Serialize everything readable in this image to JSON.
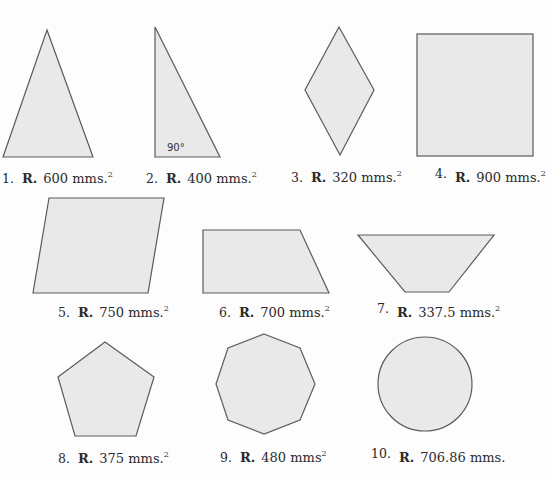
{
  "figures": [
    {
      "number": "1.",
      "shape": "isosceles-triangle",
      "answer_prefix": "R.",
      "value": "600",
      "unit": "mms.",
      "exponent": "2"
    },
    {
      "number": "2.",
      "shape": "right-triangle",
      "angle_label": "90°",
      "answer_prefix": "R.",
      "value": "400",
      "unit": "mms.",
      "exponent": "2"
    },
    {
      "number": "3.",
      "shape": "rhombus",
      "answer_prefix": "R.",
      "value": "320",
      "unit": "mms.",
      "exponent": "2"
    },
    {
      "number": "4.",
      "shape": "square",
      "answer_prefix": "R.",
      "value": "900",
      "unit": "mms.",
      "exponent": "2"
    },
    {
      "number": "5.",
      "shape": "parallelogram",
      "answer_prefix": "R.",
      "value": "750",
      "unit": "mms.",
      "exponent": "2"
    },
    {
      "number": "6.",
      "shape": "right-trapezoid",
      "answer_prefix": "R.",
      "value": "700",
      "unit": "mms.",
      "exponent": "2"
    },
    {
      "number": "7.",
      "shape": "isosceles-trapezoid",
      "answer_prefix": "R.",
      "value": "337.5",
      "unit": "mms.",
      "exponent": "2"
    },
    {
      "number": "8.",
      "shape": "pentagon",
      "answer_prefix": "R.",
      "value": "375",
      "unit": "mms.",
      "exponent": "2"
    },
    {
      "number": "9.",
      "shape": "octagon",
      "answer_prefix": "R.",
      "value": "480",
      "unit": "mms",
      "exponent": "2"
    },
    {
      "number": "10.",
      "shape": "circle",
      "answer_prefix": "R.",
      "value": "706.86",
      "unit": "mms.",
      "exponent": ""
    }
  ],
  "colors": {
    "fill": "#e9e9e9",
    "stroke": "#5b5b5b",
    "background": "#fdfdfd"
  }
}
